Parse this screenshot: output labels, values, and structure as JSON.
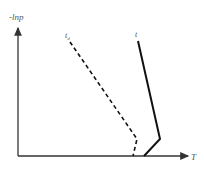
{
  "diagram": {
    "y_axis_label": "-lnp",
    "x_axis_label": "T",
    "curves": [
      {
        "name": "t",
        "style": "solid"
      },
      {
        "name": "t_d",
        "style": "dashed"
      }
    ],
    "colors": {
      "axis": "#333333",
      "curve": "#111111",
      "label": "#555555"
    }
  }
}
